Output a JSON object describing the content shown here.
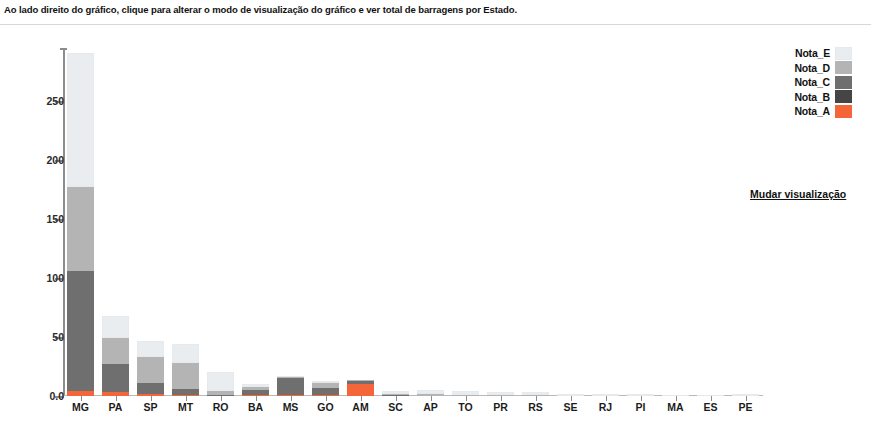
{
  "header": {
    "instruction": "Ao lado direito do gráfico, clique para alterar o modo de visualização do gráfico e ver total de barragens por Estado."
  },
  "controls": {
    "change_view_label": "Mudar visualização"
  },
  "colors": {
    "nota_e": "#e9edef",
    "nota_d": "#b4b4b4",
    "nota_c": "#6f6f6f",
    "nota_b": "#454545",
    "nota_a": "#f4663a",
    "axis": "#8c8c8c",
    "text": "#1a1a1a"
  },
  "chart_data": {
    "type": "bar",
    "stacked": true,
    "title": "",
    "subtitle": "",
    "xlabel": "",
    "ylabel": "",
    "ylim": [
      0,
      295
    ],
    "grid": false,
    "legend_position": "top-right",
    "ytick_labels": [
      "0.0",
      "50",
      "100",
      "150",
      "200",
      "250"
    ],
    "ytick_values": [
      0,
      50,
      100,
      150,
      200,
      250
    ],
    "categories": [
      "MG",
      "PA",
      "SP",
      "MT",
      "RO",
      "BA",
      "MS",
      "GO",
      "AM",
      "SC",
      "AP",
      "TO",
      "PR",
      "RS",
      "SE",
      "RJ",
      "PI",
      "MA",
      "ES",
      "PE"
    ],
    "series": [
      {
        "name": "Nota_A",
        "color": "#f4663a",
        "values": [
          4,
          3,
          2,
          1,
          0,
          1,
          1,
          1,
          10,
          0,
          0,
          0,
          0,
          0,
          0,
          0,
          0,
          0,
          0,
          0
        ]
      },
      {
        "name": "Nota_B",
        "color": "#454545",
        "values": [
          0,
          0,
          0,
          0,
          0,
          0,
          0,
          0,
          0,
          0,
          0,
          0,
          0,
          0,
          0,
          0,
          0,
          0,
          0,
          0
        ]
      },
      {
        "name": "Nota_C",
        "color": "#6f6f6f",
        "values": [
          102,
          24,
          9,
          5,
          1,
          4,
          14,
          6,
          3,
          1,
          0,
          0,
          0,
          0,
          0,
          0,
          0,
          0,
          0,
          0
        ]
      },
      {
        "name": "Nota_D",
        "color": "#b4b4b4",
        "values": [
          71,
          22,
          22,
          22,
          3,
          3,
          1,
          4,
          1,
          1,
          2,
          1,
          1,
          1,
          0,
          0,
          0,
          0,
          0,
          0
        ]
      },
      {
        "name": "Nota_E",
        "color": "#e9edef",
        "values": [
          114,
          19,
          14,
          16,
          16,
          2,
          1,
          2,
          0,
          2,
          3,
          3,
          2,
          2,
          2,
          2,
          2,
          1,
          1,
          2
        ]
      }
    ],
    "legend_entries": [
      {
        "label": "Nota_E",
        "color": "#e9edef"
      },
      {
        "label": "Nota_D",
        "color": "#b4b4b4"
      },
      {
        "label": "Nota_C",
        "color": "#6f6f6f"
      },
      {
        "label": "Nota_B",
        "color": "#454545"
      },
      {
        "label": "Nota_A",
        "color": "#f4663a"
      }
    ]
  }
}
